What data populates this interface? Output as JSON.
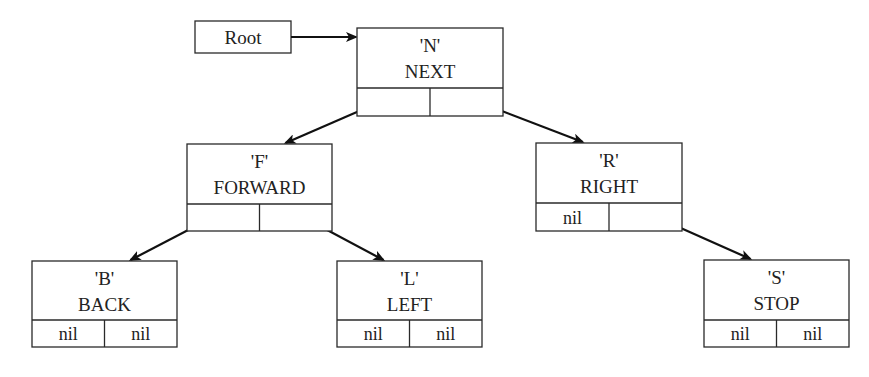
{
  "diagram": {
    "type": "binary-search-tree",
    "root_label": "Root",
    "nodes": [
      {
        "id": "N",
        "key": "'N'",
        "value": "NEXT",
        "left": "F",
        "right": "R",
        "left_text": "",
        "right_text": ""
      },
      {
        "id": "F",
        "key": "'F'",
        "value": "FORWARD",
        "left": "B",
        "right": "L",
        "left_text": "",
        "right_text": ""
      },
      {
        "id": "R",
        "key": "'R'",
        "value": "RIGHT",
        "left": null,
        "right": "S",
        "left_text": "nil",
        "right_text": ""
      },
      {
        "id": "B",
        "key": "'B'",
        "value": "BACK",
        "left": null,
        "right": null,
        "left_text": "nil",
        "right_text": "nil"
      },
      {
        "id": "L",
        "key": "'L'",
        "value": "LEFT",
        "left": null,
        "right": null,
        "left_text": "nil",
        "right_text": "nil"
      },
      {
        "id": "S",
        "key": "'S'",
        "value": "STOP",
        "left": null,
        "right": null,
        "left_text": "nil",
        "right_text": "nil"
      }
    ],
    "edges": [
      {
        "from": "Root",
        "to": "N"
      },
      {
        "from": "N",
        "side": "left",
        "to": "F"
      },
      {
        "from": "N",
        "side": "right",
        "to": "R"
      },
      {
        "from": "F",
        "side": "left",
        "to": "B"
      },
      {
        "from": "F",
        "side": "right",
        "to": "L"
      },
      {
        "from": "R",
        "side": "right",
        "to": "S"
      }
    ]
  }
}
